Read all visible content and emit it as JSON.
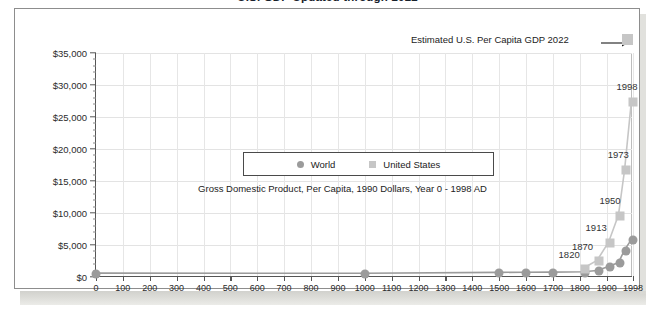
{
  "slide": {
    "title": "U.S. GDP  Updated through 2022"
  },
  "annotation": {
    "text": "Estimated U.S. Per Capita GDP 2022",
    "arrow_icon": "arrow-right-icon",
    "target_marker": "us-2022-square-marker"
  },
  "legend": {
    "position": "inside-center",
    "items": [
      {
        "label": "World",
        "marker": "circle",
        "color": "#9b9b9b"
      },
      {
        "label": "United States",
        "marker": "square",
        "color": "#c6c6c6"
      }
    ]
  },
  "chart_data": {
    "type": "line",
    "title": "U.S. GDP  Updated through 2022",
    "subtitle": "Gross Domestic Product, Per Capita, 1990 Dollars, Year 0 - 1998 AD",
    "xlabel": "",
    "ylabel": "",
    "xlim": [
      0,
      1998
    ],
    "ylim": [
      0,
      35000
    ],
    "ytick_labels": [
      "$0",
      "$5,000",
      "$10,000",
      "$15,000",
      "$20,000",
      "$25,000",
      "$30,000",
      "$35,000"
    ],
    "ytick_values": [
      0,
      5000,
      10000,
      15000,
      20000,
      25000,
      30000,
      35000
    ],
    "ytick_minor_step": 1000,
    "xtick_labels": [
      "0",
      "100",
      "200",
      "300",
      "400",
      "500",
      "600",
      "700",
      "800",
      "900",
      "1000",
      "1100",
      "1200",
      "1300",
      "1400",
      "1500",
      "1600",
      "1700",
      "1800",
      "1900",
      "1998"
    ],
    "xtick_values": [
      0,
      100,
      200,
      300,
      400,
      500,
      600,
      700,
      800,
      900,
      1000,
      1100,
      1200,
      1300,
      1400,
      1500,
      1600,
      1700,
      1800,
      1900,
      1998
    ],
    "grid": true,
    "series": [
      {
        "name": "World",
        "marker": "circle",
        "color": "#9b9b9b",
        "x": [
          0,
          1000,
          1500,
          1600,
          1700,
          1820,
          1870,
          1913,
          1950,
          1973,
          1998
        ],
        "values": [
          444,
          435,
          565,
          593,
          615,
          667,
          870,
          1510,
          2114,
          4104,
          5709
        ]
      },
      {
        "name": "United States",
        "marker": "square",
        "color": "#c6c6c6",
        "x": [
          1820,
          1870,
          1913,
          1950,
          1973,
          1998
        ],
        "values": [
          1257,
          2445,
          5301,
          9561,
          16689,
          27331
        ]
      }
    ],
    "point_labels": [
      {
        "text": "1820",
        "x": 1820,
        "y": 1257
      },
      {
        "text": "1870",
        "x": 1870,
        "y": 2445
      },
      {
        "text": "1913",
        "x": 1913,
        "y": 5301
      },
      {
        "text": "1950",
        "x": 1950,
        "y": 9561
      },
      {
        "text": "1973",
        "x": 1973,
        "y": 16689
      },
      {
        "text": "1998",
        "x": 1998,
        "y": 27331
      }
    ],
    "extra_point": {
      "label": "Estimated U.S. Per Capita GDP 2022",
      "x": 2022,
      "y": 37500
    }
  }
}
